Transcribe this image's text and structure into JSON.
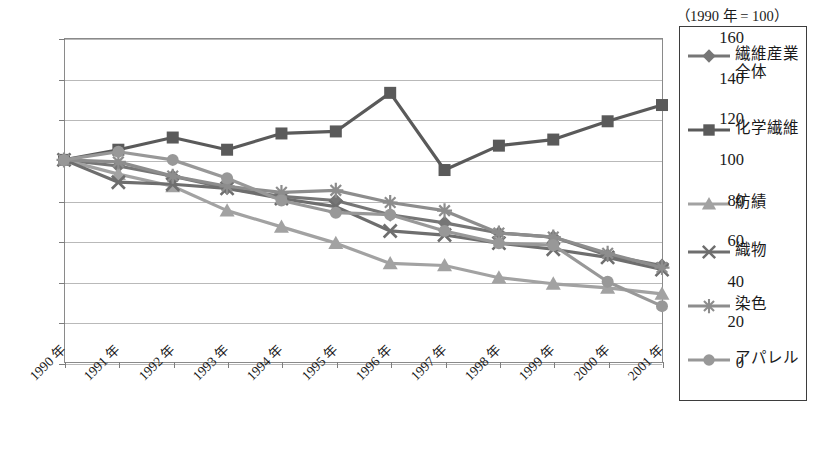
{
  "chart_data": {
    "type": "line",
    "title": "",
    "xlabel": "",
    "ylabel": "",
    "note": "（1990 年 = 100）",
    "ylim": [
      0,
      160
    ],
    "ytick_step": 20,
    "yticks": [
      "0",
      "20",
      "40",
      "60",
      "80",
      "100",
      "120",
      "140",
      "160"
    ],
    "grid": true,
    "legend_position": "right",
    "categories": [
      "1990 年",
      "1991 年",
      "1992 年",
      "1993 年",
      "1994 年",
      "1995 年",
      "1996 年",
      "1997 年",
      "1998 年",
      "1999 年",
      "2000 年",
      "2001 年"
    ],
    "series": [
      {
        "name": "繊維産業全体",
        "marker": "diamond",
        "color": "#767676",
        "values": [
          100,
          97,
          92,
          86,
          82,
          80,
          73,
          69,
          64,
          62,
          53,
          48
        ]
      },
      {
        "name": "化学繊維",
        "marker": "square",
        "color": "#5a5a5a",
        "values": [
          100,
          105,
          111,
          105,
          113,
          114,
          133,
          95,
          107,
          110,
          119,
          127
        ]
      },
      {
        "name": "紡績",
        "marker": "triangle",
        "color": "#a2a2a2",
        "values": [
          100,
          93,
          87,
          75,
          67,
          59,
          49,
          48,
          42,
          39,
          37,
          34
        ]
      },
      {
        "name": "織物",
        "marker": "x",
        "color": "#6e6e6e",
        "values": [
          100,
          89,
          88,
          86,
          81,
          77,
          65,
          63,
          59,
          56,
          52,
          46
        ]
      },
      {
        "name": "染色",
        "marker": "star",
        "color": "#8d8d8d",
        "values": [
          100,
          99,
          92,
          87,
          84,
          85,
          79,
          75,
          64,
          62,
          54,
          47
        ]
      },
      {
        "name": "アパレル",
        "marker": "circle",
        "color": "#989898",
        "values": [
          100,
          104,
          100,
          91,
          80,
          74,
          73,
          65,
          59,
          58,
          40,
          28
        ]
      }
    ]
  },
  "legend": {
    "note": "（1990 年 = 100）",
    "entries": [
      {
        "label": "繊維産業全体"
      },
      {
        "label": "化学繊維"
      },
      {
        "label": "紡績"
      },
      {
        "label": "織物"
      },
      {
        "label": "染色"
      },
      {
        "label": "アパレル"
      }
    ]
  }
}
